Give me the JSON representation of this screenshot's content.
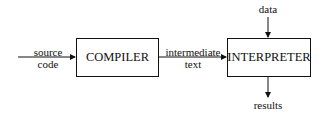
{
  "diagram": {
    "nodes": [
      {
        "id": "compiler",
        "label": "COMPILER"
      },
      {
        "id": "interpreter",
        "label": "INTERPRETER"
      }
    ],
    "labels": {
      "source_line1": "source",
      "source_line2": "code",
      "intermediate_line1": "intermediate",
      "intermediate_line2": "text",
      "data": "data",
      "results": "results"
    },
    "edges": [
      {
        "from": "source code",
        "to": "compiler"
      },
      {
        "from": "compiler",
        "to": "interpreter",
        "label": "intermediate text"
      },
      {
        "from": "data",
        "to": "interpreter"
      },
      {
        "from": "interpreter",
        "to": "results"
      }
    ],
    "colors": {
      "stroke": "#111111",
      "background": "#ffffff"
    }
  }
}
